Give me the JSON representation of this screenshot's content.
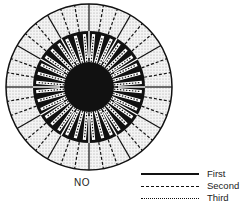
{
  "figure": {
    "caption": "NO",
    "center": [
      89,
      87
    ],
    "outer_radius": 83,
    "black_radius": 56,
    "core_radius": 25,
    "solid_dividers": 12,
    "spokes": 36,
    "colors": {
      "ink": "#111111",
      "stipple": "#d9d9d9",
      "background": "#ffffff"
    }
  },
  "legend": {
    "items": [
      {
        "style": "solid",
        "label": "First"
      },
      {
        "style": "dashed",
        "label": "Second"
      },
      {
        "style": "dotted",
        "label": "Third"
      }
    ]
  }
}
